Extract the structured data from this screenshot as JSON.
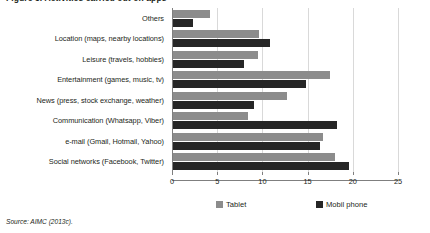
{
  "figure": {
    "title": "Figure 3. Activities carried out on apps",
    "source": "Source: AIMC (2013c)."
  },
  "legend": {
    "position": "bottom",
    "items": [
      {
        "label": "Tablet",
        "color": "#8c8c8c",
        "swatch_name": "legend-swatch-tablet"
      },
      {
        "label": "Mobil phone",
        "color": "#262626",
        "swatch_name": "legend-swatch-mobil-phone"
      }
    ]
  },
  "axis": {
    "ticks": [
      "0",
      "5",
      "10",
      "15",
      "20",
      "25"
    ]
  },
  "chart_data": {
    "type": "bar",
    "orientation": "horizontal",
    "title": "Figure 3. Activities carried out on apps",
    "xlabel": "",
    "ylabel": "",
    "xlim": [
      0,
      25
    ],
    "xticks": [
      0,
      5,
      10,
      15,
      20,
      25
    ],
    "grid": true,
    "legend": "bottom",
    "categories": [
      "Others",
      "Location (maps, nearby locations)",
      "Leisure (travels, hobbies)",
      "Entertainment (games, music, tv)",
      "News (press, stock exchange, weather)",
      "Communication (Whatsapp, Viber)",
      "e-mail (Gmail, Hotmail, Yahoo)",
      "Social networks (Facebook, Twitter)"
    ],
    "series": [
      {
        "name": "Tablet",
        "color": "#8c8c8c",
        "values": [
          4.1,
          9.5,
          9.4,
          17.4,
          12.6,
          8.3,
          16.6,
          17.9
        ]
      },
      {
        "name": "Mobil phone",
        "color": "#262626",
        "values": [
          2.2,
          10.7,
          7.9,
          14.7,
          9.0,
          18.1,
          16.3,
          19.5
        ]
      }
    ]
  }
}
